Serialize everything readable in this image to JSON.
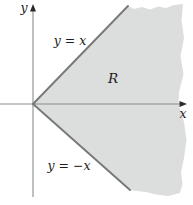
{
  "figure": {
    "labels": {
      "y_axis": "y",
      "x_axis": "x",
      "upper_line": "y = x",
      "lower_line": "y = −x",
      "region": "R"
    },
    "colors": {
      "background": "#ffffff",
      "region_fill": "#dcdddd",
      "boundary_line": "#767879",
      "axis_line": "#8a8c8c",
      "arrow": "#2b2b2b",
      "text": "#1c1c1c"
    }
  }
}
